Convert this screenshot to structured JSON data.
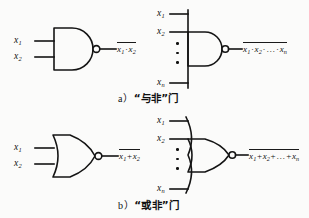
{
  "figure": {
    "title_a": "a）“与非”门",
    "title_b": "b）“或非”门",
    "ink_color": "#141414",
    "paper_color": "#fbfbfa"
  },
  "captions": {
    "a": {
      "marker": "a）",
      "quote_open": "“",
      "term": "与非",
      "quote_close": "”",
      "word": "门"
    },
    "b": {
      "marker": "b）",
      "quote_open": "“",
      "term": "或非",
      "quote_close": "”",
      "word": "门"
    }
  },
  "gates": {
    "nand2": {
      "type": "NAND",
      "inputs": [
        {
          "label": "x",
          "sub": "1"
        },
        {
          "label": "x",
          "sub": "2"
        }
      ],
      "output": {
        "overbar": true,
        "terms": [
          {
            "label": "x",
            "sub": "1"
          },
          {
            "label": "x",
            "sub": "2"
          }
        ],
        "operator": "·",
        "text": "x1 · x2"
      }
    },
    "nand_n": {
      "type": "NAND",
      "inputs": [
        {
          "label": "x",
          "sub": "1"
        },
        {
          "label": "x",
          "sub": "2"
        },
        {
          "label": "x",
          "sub": "n"
        }
      ],
      "ellipsis": "⋮",
      "output": {
        "overbar": true,
        "terms": [
          {
            "label": "x",
            "sub": "1"
          },
          {
            "label": "x",
            "sub": "2"
          },
          {
            "label": "x",
            "sub": "n"
          }
        ],
        "operator": "·",
        "middle": "…",
        "text": "x1 · x2 · … · xn"
      }
    },
    "nor2": {
      "type": "NOR",
      "inputs": [
        {
          "label": "x",
          "sub": "1"
        },
        {
          "label": "x",
          "sub": "2"
        }
      ],
      "output": {
        "overbar": true,
        "terms": [
          {
            "label": "x",
            "sub": "1"
          },
          {
            "label": "x",
            "sub": "2"
          }
        ],
        "operator": "+",
        "text": "x1+x2"
      }
    },
    "nor_n": {
      "type": "NOR",
      "inputs": [
        {
          "label": "x",
          "sub": "1"
        },
        {
          "label": "x",
          "sub": "2"
        },
        {
          "label": "x",
          "sub": "n"
        }
      ],
      "ellipsis": "⋮",
      "output": {
        "overbar": true,
        "terms": [
          {
            "label": "x",
            "sub": "1"
          },
          {
            "label": "x",
            "sub": "2"
          },
          {
            "label": "x",
            "sub": "n"
          }
        ],
        "operator": "+",
        "middle": "…",
        "text": "x1+x2+…+xn"
      }
    }
  },
  "labels": {
    "nand2_in1_base": "x",
    "nand2_in1_sub": "1",
    "nand2_in2_base": "x",
    "nand2_in2_sub": "2",
    "nandn_in1_base": "x",
    "nandn_in1_sub": "1",
    "nandn_in2_base": "x",
    "nandn_in2_sub": "2",
    "nandn_inn_base": "x",
    "nandn_inn_sub": "n",
    "nor2_in1_base": "x",
    "nor2_in1_sub": "1",
    "nor2_in2_base": "x",
    "nor2_in2_sub": "2",
    "norn_in1_base": "x",
    "norn_in1_sub": "1",
    "norn_in2_base": "x",
    "norn_in2_sub": "2",
    "norn_inn_base": "x",
    "norn_inn_sub": "n"
  },
  "expressions": {
    "nand2": {
      "t1": "x",
      "s1": "1",
      "op1": "·",
      "t2": "x",
      "s2": "2"
    },
    "nandn": {
      "t1": "x",
      "s1": "1",
      "op1": "·",
      "t2": "x",
      "s2": "2",
      "op2": "·",
      "mid": "…",
      "op3": "·",
      "t3": "x",
      "s3": "n"
    },
    "nor2": {
      "t1": "x",
      "s1": "1",
      "op1": "+",
      "t2": "x",
      "s2": "2"
    },
    "norn": {
      "t1": "x",
      "s1": "1",
      "op1": "+",
      "t2": "x",
      "s2": "2",
      "op2": "+",
      "mid": "…",
      "op3": "+",
      "t3": "x",
      "s3": "n"
    }
  }
}
